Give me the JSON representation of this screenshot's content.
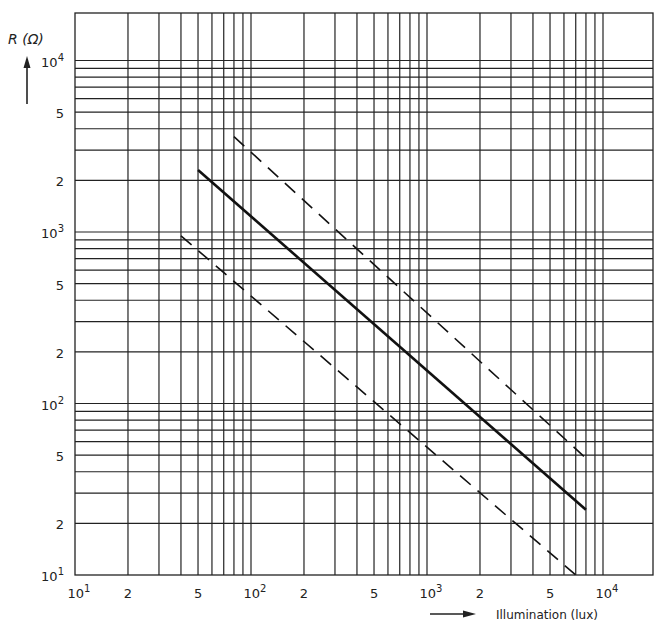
{
  "chart_data": {
    "type": "line",
    "title": "",
    "xlabel": "Illumination (lux)",
    "ylabel": "R (Ω)",
    "xscale": "log",
    "yscale": "log",
    "xlim": [
      10,
      10000
    ],
    "ylim": [
      10,
      10000
    ],
    "grid": true,
    "x_tick_labels": [
      "10¹",
      "2",
      "5",
      "10²",
      "2",
      "5",
      "10³",
      "2",
      "5",
      "10⁴"
    ],
    "x_tick_values": [
      10,
      20,
      50,
      100,
      200,
      500,
      1000,
      2000,
      5000,
      10000
    ],
    "y_tick_labels": [
      "10⁴",
      "5",
      "2",
      "10³",
      "5",
      "2",
      "10²",
      "5",
      "2",
      "10¹"
    ],
    "y_tick_values": [
      10000,
      5000,
      2000,
      1000,
      500,
      200,
      100,
      50,
      20,
      10
    ],
    "series": [
      {
        "name": "typical",
        "style": "solid",
        "x": [
          50,
          8000
        ],
        "y": [
          2300,
          24
        ]
      },
      {
        "name": "maximum",
        "style": "dashed",
        "x": [
          80,
          8000
        ],
        "y": [
          3600,
          48
        ]
      },
      {
        "name": "minimum",
        "style": "dashed",
        "x": [
          40,
          7000
        ],
        "y": [
          950,
          10
        ]
      }
    ],
    "legend": null
  },
  "labels": {
    "ylabel": "R (Ω)",
    "xlabel": "Illumination (lux)"
  }
}
